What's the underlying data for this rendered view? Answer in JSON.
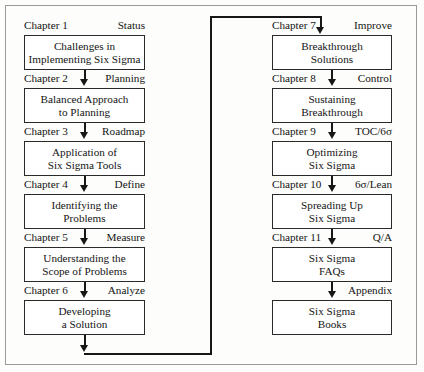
{
  "diagram": {
    "accent_color": "#171717",
    "border_color": "#9a9a96",
    "box_border_color": "#2a2a2a",
    "background_color": "#fdfdfb"
  },
  "left_column": [
    {
      "chapter": "Chapter 1",
      "phase": "Status",
      "line1": "Challenges in",
      "line2": "Implementing Six Sigma"
    },
    {
      "chapter": "Chapter 2",
      "phase": "Planning",
      "line1": "Balanced Approach",
      "line2": "to Planning"
    },
    {
      "chapter": "Chapter 3",
      "phase": "Roadmap",
      "line1": "Application of",
      "line2": "Six Sigma Tools"
    },
    {
      "chapter": "Chapter 4",
      "phase": "Define",
      "line1": "Identifying the",
      "line2": "Problems"
    },
    {
      "chapter": "Chapter 5",
      "phase": "Measure",
      "line1": "Understanding the",
      "line2": "Scope of Problems"
    },
    {
      "chapter": "Chapter 6",
      "phase": "Analyze",
      "line1": "Developing",
      "line2": "a Solution"
    }
  ],
  "right_column": [
    {
      "chapter": "Chapter 7",
      "phase": "Improve",
      "line1": "Breakthrough",
      "line2": "Solutions"
    },
    {
      "chapter": "Chapter 8",
      "phase": "Control",
      "line1": "Sustaining",
      "line2": "Breakthrough"
    },
    {
      "chapter": "Chapter 9",
      "phase": "TOC/6σ",
      "line1": "Optimizing",
      "line2": "Six Sigma"
    },
    {
      "chapter": "Chapter 10",
      "phase": "6σ/Lean",
      "line1": "Spreading Up",
      "line2": "Six Sigma"
    },
    {
      "chapter": "Chapter 11",
      "phase": "Q/A",
      "line1": "Six Sigma",
      "line2": "FAQs"
    },
    {
      "chapter": "",
      "phase": "Appendix",
      "line1": "Six Sigma",
      "line2": "Books"
    }
  ]
}
